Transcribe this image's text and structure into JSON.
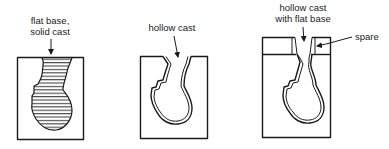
{
  "diagram": {
    "panels": [
      {
        "id": "solid-cast",
        "label_lines": [
          "flat base,",
          "solid cast"
        ],
        "fill": "hatched"
      },
      {
        "id": "hollow-cast",
        "label_lines": [
          "hollow cast"
        ],
        "fill": "hollow"
      },
      {
        "id": "hollow-cast-flat-base",
        "label_lines": [
          "hollow cast",
          "with flat base"
        ],
        "fill": "hollow",
        "callout": "spare"
      }
    ],
    "colors": {
      "ink": "#1a1a1a",
      "background": "#ffffff"
    }
  }
}
